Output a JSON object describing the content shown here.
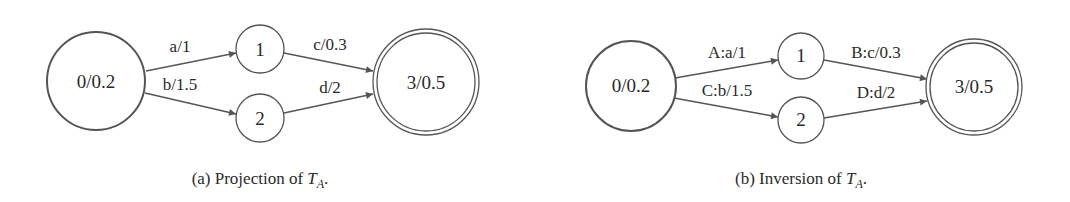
{
  "figures": [
    {
      "id": "a",
      "caption_prefix": "(a) Projection of ",
      "caption_var": "T",
      "caption_sub": "A",
      "caption_suffix": ".",
      "nodes": [
        {
          "id": "0",
          "label": "0/0.2",
          "initial": true,
          "final": false
        },
        {
          "id": "1",
          "label": "1",
          "initial": false,
          "final": false
        },
        {
          "id": "2",
          "label": "2",
          "initial": false,
          "final": false
        },
        {
          "id": "3",
          "label": "3/0.5",
          "initial": false,
          "final": true
        }
      ],
      "edges": [
        {
          "from": "0",
          "to": "1",
          "label": "a/1"
        },
        {
          "from": "0",
          "to": "2",
          "label": "b/1.5"
        },
        {
          "from": "1",
          "to": "3",
          "label": "c/0.3"
        },
        {
          "from": "2",
          "to": "3",
          "label": "d/2"
        }
      ]
    },
    {
      "id": "b",
      "caption_prefix": "(b) Inversion of ",
      "caption_var": "T",
      "caption_sub": "A",
      "caption_suffix": ".",
      "nodes": [
        {
          "id": "0",
          "label": "0/0.2",
          "initial": true,
          "final": false
        },
        {
          "id": "1",
          "label": "1",
          "initial": false,
          "final": false
        },
        {
          "id": "2",
          "label": "2",
          "initial": false,
          "final": false
        },
        {
          "id": "3",
          "label": "3/0.5",
          "initial": false,
          "final": true
        }
      ],
      "edges": [
        {
          "from": "0",
          "to": "1",
          "label": "A:a/1"
        },
        {
          "from": "0",
          "to": "2",
          "label": "C:b/1.5"
        },
        {
          "from": "1",
          "to": "3",
          "label": "B:c/0.3"
        },
        {
          "from": "2",
          "to": "3",
          "label": "D:d/2"
        }
      ]
    }
  ],
  "colors": {
    "stroke": "#555555",
    "text": "#2a2a2a",
    "background": "#ffffff"
  }
}
